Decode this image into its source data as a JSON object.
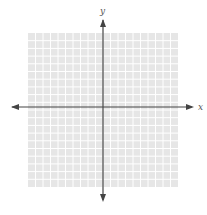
{
  "graph": {
    "title": "Blank coordinate grid",
    "x_axis_label": "x",
    "y_axis_label": "y",
    "grid_cells_x": 20,
    "grid_cells_y": 20,
    "colors": {
      "grid_background": "#e6e6e6",
      "grid_lines": "#ffffff",
      "axes": "#444444",
      "labels": "#555555"
    }
  }
}
